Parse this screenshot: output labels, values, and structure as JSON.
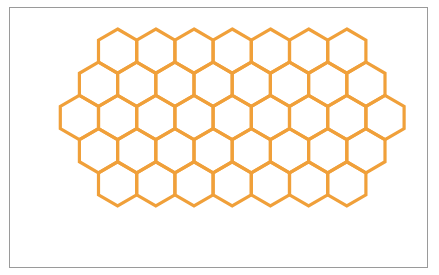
{
  "figure": {
    "canvas": {
      "width": 439,
      "height": 275
    },
    "background_color": "#ffffff",
    "frame": {
      "name": "figure-border",
      "x": 9,
      "y": 7,
      "width": 419,
      "height": 261,
      "stroke_color": "#9a9a9a",
      "stroke_width": 1,
      "fill": "#ffffff"
    }
  },
  "honeycomb": {
    "stroke_color": "#F0A03A",
    "stroke_width": 3.2,
    "fill": "none",
    "orientation": "pointy-top",
    "hex_width": 38.2,
    "hex_height": 44.2,
    "row_vertical_step": 33.2,
    "column_horizontal_step": 38.2,
    "grid_left": 41,
    "grid_right": 412,
    "grid_top": 29,
    "grid_bottom": 238,
    "row_count": 5,
    "total_hexagons": 39,
    "rows": [
      {
        "index": 0,
        "count": 7,
        "center_y": 51.1,
        "first_center_x": 117.6,
        "offset": "indented"
      },
      {
        "index": 1,
        "count": 8,
        "center_y": 84.3,
        "first_center_x": 98.5,
        "offset": "half-step"
      },
      {
        "index": 2,
        "count": 9,
        "center_y": 117.5,
        "first_center_x": 79.4,
        "offset": "full-width"
      },
      {
        "index": 3,
        "count": 8,
        "center_y": 150.7,
        "first_center_x": 98.5,
        "offset": "half-step"
      },
      {
        "index": 4,
        "count": 7,
        "center_y": 183.9,
        "first_center_x": 117.6,
        "offset": "indented"
      }
    ]
  }
}
